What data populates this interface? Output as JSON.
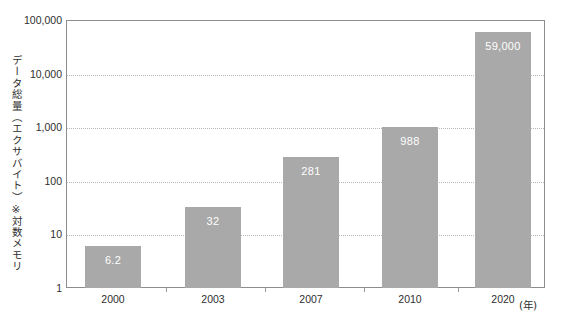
{
  "chart_data": {
    "type": "bar",
    "title": "",
    "subtitle": "",
    "xlabel": "(年)",
    "ylabel": "データ総量（エクサバイト）※対数メモリ",
    "categories": [
      "2000",
      "2003",
      "2007",
      "2010",
      "2020"
    ],
    "values": [
      6.2,
      32,
      281,
      988,
      59000
    ],
    "value_labels": [
      "6.2",
      "32",
      "281",
      "988",
      "59,000"
    ],
    "scale": "log",
    "ylim": [
      1,
      100000
    ],
    "y_ticks": [
      "1",
      "10",
      "100",
      "1,000",
      "10,000",
      "100,000"
    ],
    "y_tick_values": [
      1,
      10,
      100,
      1000,
      10000,
      100000
    ],
    "grid": true,
    "legend": "none",
    "series": [
      {
        "name": "データ総量",
        "values": [
          6.2,
          32,
          281,
          988,
          59000
        ]
      }
    ],
    "colors": {
      "bar": "#a9a9a9",
      "value_label": "#ffffff",
      "gridline": "#b9b9b9",
      "frame": "#8d8d8d",
      "text": "#2e2e2e",
      "background": "#ffffff"
    }
  }
}
